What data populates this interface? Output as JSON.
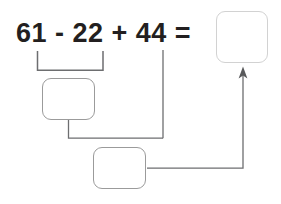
{
  "worksheet": {
    "expression": "61 - 22 + 44 =",
    "operands": [
      "61",
      "22",
      "44"
    ],
    "operators": [
      "-",
      "+"
    ],
    "equals_sign": "="
  },
  "boxes": {
    "answer": {
      "name": "answer-box",
      "value": "",
      "placeholder": ""
    },
    "step1": {
      "name": "step-1-box",
      "value": "",
      "placeholder": ""
    },
    "step2": {
      "name": "step-2-box",
      "value": "",
      "placeholder": ""
    }
  },
  "colors": {
    "text": "#231f20",
    "box_border": "#9b9b9b",
    "answer_border": "#d2d2d2",
    "connector": "#6d6e70",
    "background": "#ffffff"
  },
  "connectors": {
    "bracket_label": "bracket-under-61-minus-22",
    "step1_to_step2_label": "connector-step1-to-step2",
    "operand44_to_step2_label": "connector-44-to-step2",
    "step2_to_answer_label": "arrow-step2-to-answer"
  }
}
